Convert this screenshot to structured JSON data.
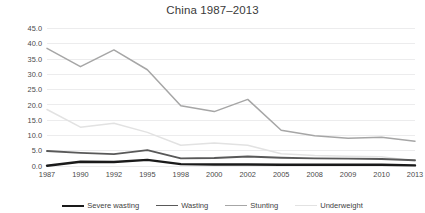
{
  "chart_data": {
    "type": "line",
    "title": "China 1987–2013",
    "xlabel": "",
    "ylabel": "",
    "categories": [
      "1987",
      "1990",
      "1992",
      "1995",
      "1998",
      "2000",
      "2002",
      "2005",
      "2008",
      "2009",
      "2010",
      "2013"
    ],
    "ylim": [
      0.0,
      45.0
    ],
    "ytick_step": 5.0,
    "ytick_labels": [
      "0.0",
      "5.0",
      "10.0",
      "15.0",
      "20.0",
      "25.0",
      "30.0",
      "35.0",
      "40.0",
      "45.0"
    ],
    "grid": true,
    "legend_position": "bottom",
    "series": [
      {
        "name": "Severe wasting",
        "color": "#1a1a1a",
        "width": 2.4,
        "values": [
          0.1,
          1.4,
          1.3,
          2.0,
          0.6,
          0.5,
          0.5,
          0.4,
          0.4,
          0.4,
          0.4,
          0.2
        ]
      },
      {
        "name": "Wasting",
        "color": "#595959",
        "width": 1.9,
        "values": [
          4.9,
          4.3,
          3.9,
          5.2,
          2.5,
          2.6,
          3.1,
          2.7,
          2.5,
          2.4,
          2.3,
          1.9
        ]
      },
      {
        "name": "Stunting",
        "color": "#a6a6a6",
        "width": 1.5,
        "values": [
          38.5,
          32.5,
          38.0,
          31.5,
          19.7,
          17.8,
          21.8,
          11.7,
          9.9,
          9.1,
          9.4,
          8.1
        ]
      },
      {
        "name": "Underweight",
        "color": "#e2e2e2",
        "width": 1.5,
        "values": [
          18.5,
          12.7,
          14.0,
          11.0,
          6.8,
          7.5,
          6.8,
          4.0,
          3.4,
          3.2,
          3.0,
          1.6
        ]
      }
    ]
  }
}
